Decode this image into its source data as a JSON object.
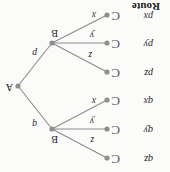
{
  "figure": {
    "title_label": "Route",
    "orientation_note": "rotated-180",
    "colors": {
      "edge": "#8c8c8c",
      "node": "#8f8f8f",
      "text": "#1b1b1b",
      "background": "#fbfbfa"
    }
  },
  "sources": [
    {
      "id": "qz",
      "label": "qz",
      "x": 63,
      "y": 14,
      "text_x": 17,
      "text_y": 8,
      "paren_x": 50,
      "paren_y": 6
    },
    {
      "id": "qy",
      "label": "qy",
      "x": 63,
      "y": 43,
      "text_x": 17,
      "text_y": 37,
      "paren_x": 50,
      "paren_y": 35
    },
    {
      "id": "qx",
      "label": "qx",
      "x": 63,
      "y": 72,
      "text_x": 17,
      "text_y": 66,
      "paren_x": 50,
      "paren_y": 64
    },
    {
      "id": "pz",
      "label": "pz",
      "x": 63,
      "y": 100,
      "text_x": 17,
      "text_y": 94,
      "paren_x": 50,
      "paren_y": 92
    },
    {
      "id": "py",
      "label": "py",
      "x": 63,
      "y": 129,
      "text_x": 17,
      "text_y": 123,
      "paren_x": 50,
      "paren_y": 121
    },
    {
      "id": "px",
      "label": "px",
      "x": 63,
      "y": 157,
      "text_x": 17,
      "text_y": 151,
      "paren_x": 50,
      "paren_y": 149
    }
  ],
  "hubs": [
    {
      "id": "B-upper",
      "label": "B",
      "x": 118,
      "y": 43,
      "text_x": 112,
      "text_y": 28
    },
    {
      "id": "B-lower",
      "label": "B",
      "x": 118,
      "y": 129,
      "text_x": 112,
      "text_y": 134
    }
  ],
  "sink": {
    "id": "A",
    "label": "A",
    "x": 152,
    "y": 86,
    "text_x": 157,
    "text_y": 80
  },
  "edges": [
    {
      "from": "qz",
      "to": "B-upper",
      "label": "z",
      "label_x": 76,
      "label_y": 28
    },
    {
      "from": "qy",
      "to": "B-upper",
      "label": "y",
      "label_x": 76,
      "label_y": 47
    },
    {
      "from": "qx",
      "to": "B-upper",
      "label": "x",
      "label_x": 74,
      "label_y": 67
    },
    {
      "from": "pz",
      "to": "B-lower",
      "label": "z",
      "label_x": 78,
      "label_y": 113
    },
    {
      "from": "py",
      "to": "B-lower",
      "label": "y",
      "label_x": 76,
      "label_y": 133
    },
    {
      "from": "px",
      "to": "B-lower",
      "label": "x",
      "label_x": 74,
      "label_y": 153
    },
    {
      "from": "B-upper",
      "to": "A",
      "label": "q",
      "label_x": 133,
      "label_y": 44
    },
    {
      "from": "B-lower",
      "to": "A",
      "label": "p",
      "label_x": 133,
      "label_y": 115
    }
  ],
  "route_label": {
    "text": "Route",
    "x": 10,
    "y": 160
  }
}
